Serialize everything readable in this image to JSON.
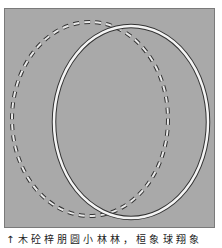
{
  "figure": {
    "background_color": "#a9a9a9",
    "border_color": "#7a7a7a",
    "shapes": [
      {
        "name": "dashed-ellipse",
        "style": "dashed",
        "cx": 85,
        "cy": 110,
        "rx": 78,
        "ry": 97,
        "stroke": "#333333",
        "fill_dash": "#e8e8e8"
      },
      {
        "name": "solid-ellipse",
        "style": "double-line",
        "cx": 126,
        "cy": 113,
        "rx": 77,
        "ry": 96,
        "stroke": "#333333",
        "fill_line": "#f4f4f4"
      }
    ]
  },
  "caption": {
    "text": "↑ 木 砼 梓 朋 圆 小 林 林 ， 桓 象 球 翔 象"
  }
}
